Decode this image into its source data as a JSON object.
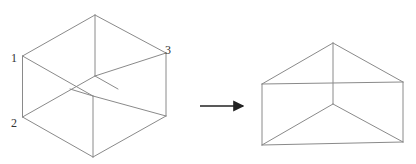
{
  "figure": {
    "cube": {
      "name": "cube",
      "vertex_labels": [
        "1",
        "2",
        "3"
      ]
    },
    "arrow": {
      "direction": "right"
    },
    "prism": {
      "name": "triangular-prism"
    },
    "colors": {
      "edge": "#8a8a8a",
      "arrow": "#222222",
      "label": "#333333"
    }
  }
}
